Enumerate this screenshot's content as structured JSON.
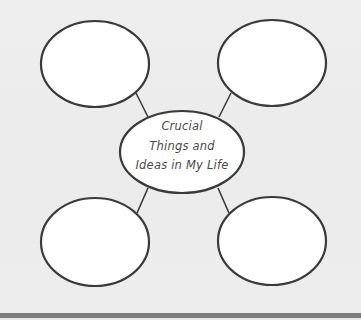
{
  "diagram": {
    "type": "concept-web",
    "center": {
      "lines": [
        "Crucial",
        "Things and",
        "Ideas in My Life"
      ],
      "title": "Crucial Things and Ideas in My Life"
    },
    "outer_nodes": [
      {
        "position": "top-left",
        "text": ""
      },
      {
        "position": "top-right",
        "text": ""
      },
      {
        "position": "bottom-left",
        "text": ""
      },
      {
        "position": "bottom-right",
        "text": ""
      }
    ],
    "colors": {
      "background": "#ececec",
      "node_fill": "#ffffff",
      "stroke": "#3a3a3a",
      "text": "#4a4a4a",
      "bottom_bar": "#7d7d7d"
    }
  }
}
